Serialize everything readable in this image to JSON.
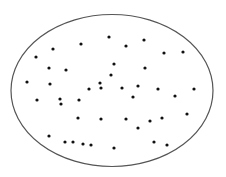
{
  "diagram": {
    "type": "ellipse-with-points",
    "background": "#ffffff",
    "ellipse": {
      "cx": 112,
      "cy": 90.5,
      "rx": 101,
      "ry": 76,
      "stroke": "#555555",
      "stroke_width": 1.2,
      "fill": "none"
    },
    "point_style": {
      "r": 1.6,
      "fill": "#111111"
    },
    "points": [
      {
        "x": 109,
        "y": 37
      },
      {
        "x": 144,
        "y": 40
      },
      {
        "x": 81,
        "y": 44
      },
      {
        "x": 126,
        "y": 46
      },
      {
        "x": 53,
        "y": 49
      },
      {
        "x": 183,
        "y": 52
      },
      {
        "x": 164,
        "y": 53
      },
      {
        "x": 36,
        "y": 57
      },
      {
        "x": 114,
        "y": 64
      },
      {
        "x": 49,
        "y": 68
      },
      {
        "x": 66,
        "y": 70
      },
      {
        "x": 145,
        "y": 68
      },
      {
        "x": 111,
        "y": 75
      },
      {
        "x": 100,
        "y": 83
      },
      {
        "x": 138,
        "y": 86
      },
      {
        "x": 89,
        "y": 89
      },
      {
        "x": 122,
        "y": 88
      },
      {
        "x": 27,
        "y": 82
      },
      {
        "x": 50,
        "y": 84
      },
      {
        "x": 158,
        "y": 89
      },
      {
        "x": 194,
        "y": 89
      },
      {
        "x": 37,
        "y": 100
      },
      {
        "x": 60,
        "y": 99
      },
      {
        "x": 61,
        "y": 104
      },
      {
        "x": 79,
        "y": 100
      },
      {
        "x": 175,
        "y": 96
      },
      {
        "x": 133,
        "y": 97
      },
      {
        "x": 101,
        "y": 88
      },
      {
        "x": 78,
        "y": 118
      },
      {
        "x": 101,
        "y": 119
      },
      {
        "x": 126,
        "y": 119
      },
      {
        "x": 150,
        "y": 121
      },
      {
        "x": 187,
        "y": 114
      },
      {
        "x": 162,
        "y": 118
      },
      {
        "x": 138,
        "y": 128
      },
      {
        "x": 49,
        "y": 136
      },
      {
        "x": 65,
        "y": 142
      },
      {
        "x": 91,
        "y": 145
      },
      {
        "x": 83,
        "y": 144
      },
      {
        "x": 73,
        "y": 142
      },
      {
        "x": 114,
        "y": 148
      },
      {
        "x": 154,
        "y": 142
      },
      {
        "x": 167,
        "y": 145
      }
    ]
  }
}
